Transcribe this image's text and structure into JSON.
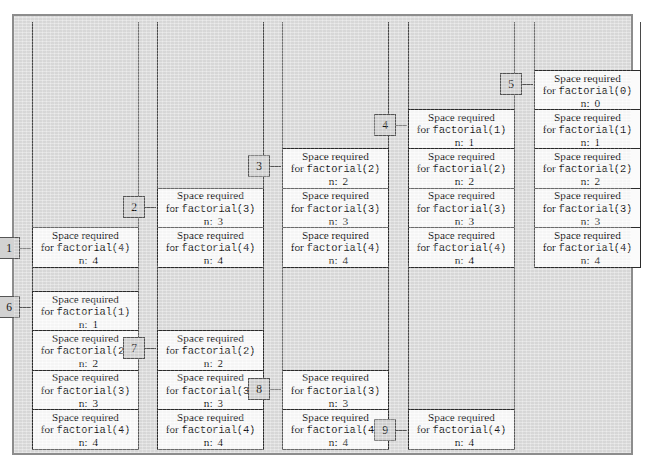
{
  "diagram": {
    "frame_line1": "Space required",
    "frame_line2_prefix": "for ",
    "frame_line3_prefix": "n:",
    "colors": {
      "panel_background": "#dcdcdc",
      "panel_border": "#8d8d8d",
      "frame_fill": "#fbfbfb",
      "frame_border": "#2b2b2b",
      "rail": "#4a4a4a",
      "badge_fill": "#d2d2d2",
      "badge_border": "#555555",
      "text": "#111111"
    }
  },
  "stacks": [
    {
      "badge": "1",
      "left": 30,
      "top": 20,
      "width": 107,
      "rail_height": 205,
      "row": "top",
      "frames": [
        {
          "call": "factorial(4)",
          "n": "4"
        }
      ]
    },
    {
      "badge": "2",
      "left": 155,
      "top": 20,
      "width": 107,
      "rail_height": 164,
      "row": "top",
      "frames": [
        {
          "call": "factorial(3)",
          "n": "3"
        },
        {
          "call": "factorial(4)",
          "n": "4"
        }
      ]
    },
    {
      "badge": "3",
      "left": 280,
      "top": 20,
      "width": 107,
      "rail_height": 123,
      "row": "top",
      "frames": [
        {
          "call": "factorial(2)",
          "n": "2"
        },
        {
          "call": "factorial(3)",
          "n": "3"
        },
        {
          "call": "factorial(4)",
          "n": "4"
        }
      ]
    },
    {
      "badge": "4",
      "left": 406,
      "top": 20,
      "width": 107,
      "rail_height": 82,
      "row": "top",
      "frames": [
        {
          "call": "factorial(1)",
          "n": "1"
        },
        {
          "call": "factorial(2)",
          "n": "2"
        },
        {
          "call": "factorial(3)",
          "n": "3"
        },
        {
          "call": "factorial(4)",
          "n": "4"
        }
      ]
    },
    {
      "badge": "5",
      "left": 532,
      "top": 20,
      "width": 107,
      "rail_height": 41,
      "row": "top",
      "frames": [
        {
          "call": "factorial(0)",
          "n": "0"
        },
        {
          "call": "factorial(1)",
          "n": "1"
        },
        {
          "call": "factorial(2)",
          "n": "2"
        },
        {
          "call": "factorial(3)",
          "n": "3"
        },
        {
          "call": "factorial(4)",
          "n": "4"
        }
      ]
    },
    {
      "badge": "6",
      "left": 30,
      "top": 262,
      "width": 107,
      "rail_height": 22,
      "row": "bottom",
      "frames": [
        {
          "call": "factorial(1)",
          "n": "1"
        },
        {
          "call": "factorial(2)",
          "n": "2"
        },
        {
          "call": "factorial(3)",
          "n": "3"
        },
        {
          "call": "factorial(4)",
          "n": "4"
        }
      ]
    },
    {
      "badge": "7",
      "left": 155,
      "top": 262,
      "width": 107,
      "rail_height": 63,
      "row": "bottom",
      "frames": [
        {
          "call": "factorial(2)",
          "n": "2"
        },
        {
          "call": "factorial(3)",
          "n": "3"
        },
        {
          "call": "factorial(4)",
          "n": "4"
        }
      ]
    },
    {
      "badge": "8",
      "left": 280,
      "top": 262,
      "width": 107,
      "rail_height": 104,
      "row": "bottom",
      "frames": [
        {
          "call": "factorial(3)",
          "n": "3"
        },
        {
          "call": "factorial(4)",
          "n": "4"
        }
      ]
    },
    {
      "badge": "9",
      "left": 406,
      "top": 262,
      "width": 107,
      "rail_height": 145,
      "row": "bottom",
      "frames": [
        {
          "call": "factorial(4)",
          "n": "4"
        }
      ]
    }
  ]
}
